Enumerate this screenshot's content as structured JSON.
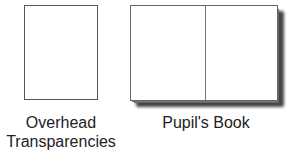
{
  "items": [
    {
      "label_line1": "Overhead",
      "label_line2": "Transparencies",
      "shape": "single-page-rectangle"
    },
    {
      "label": "Pupil's Book",
      "shape": "open-book"
    }
  ]
}
